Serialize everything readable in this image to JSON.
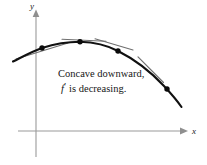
{
  "figure": {
    "background_color": "#ffffff",
    "axes": {
      "color": "#9a9a9a",
      "x_axis_label": "x",
      "y_axis_label": "y",
      "origin": {
        "x": 36,
        "y": 131
      },
      "x_range_px": [
        18,
        184
      ],
      "y_range_px": [
        12,
        157
      ]
    },
    "caption": {
      "line1": "Concave downward,",
      "line2_function": "f",
      "line2_prime": "′",
      "line2_rest": "is decreasing."
    },
    "curve": {
      "color": "#111111",
      "stroke_width": 2.1,
      "description": "concave-downward parabola-like arc",
      "points_px": [
        {
          "x": 13,
          "y": 61
        },
        {
          "x": 30,
          "y": 53
        },
        {
          "x": 42,
          "y": 48
        },
        {
          "x": 60,
          "y": 43.5
        },
        {
          "x": 80,
          "y": 42
        },
        {
          "x": 100,
          "y": 45
        },
        {
          "x": 118,
          "y": 51
        },
        {
          "x": 140,
          "y": 62
        },
        {
          "x": 160,
          "y": 78
        },
        {
          "x": 172,
          "y": 92
        },
        {
          "x": 181,
          "y": 106
        }
      ]
    },
    "marked_points": [
      {
        "name": "point-1",
        "x": 42,
        "y": 48,
        "radius": 2.6
      },
      {
        "name": "point-2",
        "x": 80,
        "y": 42,
        "radius": 2.6
      },
      {
        "name": "point-3",
        "x": 118,
        "y": 51,
        "radius": 2.6
      },
      {
        "name": "point-4",
        "x": 167,
        "y": 88,
        "radius": 2.6
      }
    ],
    "tangent_lines": [
      {
        "name": "tangent-1",
        "x1": 16,
        "y1": 59,
        "x2": 68,
        "y2": 43,
        "slope_note": "positive slope"
      },
      {
        "name": "tangent-2",
        "x1": 62,
        "y1": 39,
        "x2": 106,
        "y2": 41,
        "slope_note": "near zero slope"
      },
      {
        "name": "tangent-3",
        "x1": 95,
        "y1": 39,
        "x2": 133,
        "y2": 50,
        "slope_note": "slightly negative slope"
      },
      {
        "name": "tangent-4",
        "x1": 138,
        "y1": 57,
        "x2": 163,
        "y2": 82,
        "slope_note": "steep negative slope"
      }
    ],
    "tangent_style": {
      "color": "#6f6f6f",
      "stroke_width": 1.1
    }
  }
}
